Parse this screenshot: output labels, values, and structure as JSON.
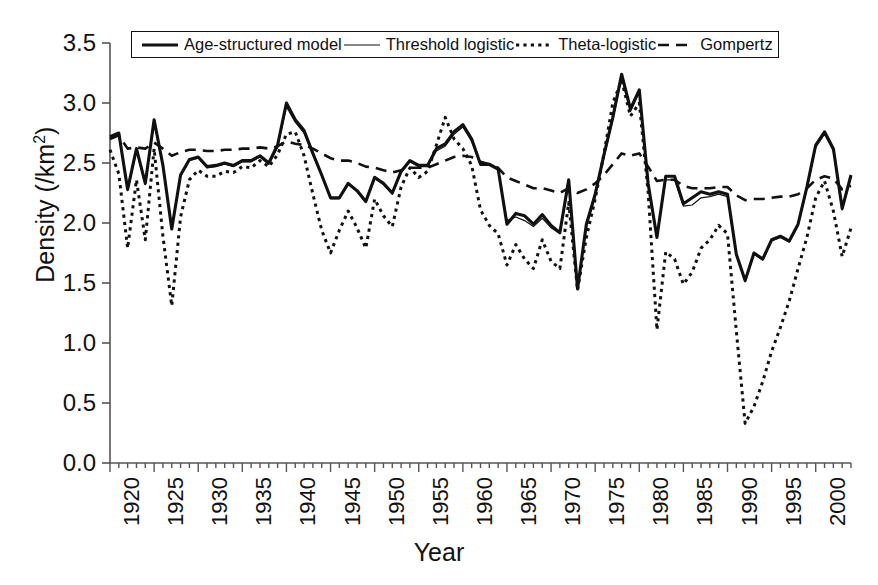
{
  "chart_data": {
    "type": "line",
    "title": "",
    "xlabel": "Year",
    "ylabel": "Density (/km2)",
    "ylabel_html": "Density (/km<sup>2</sup>)",
    "xlim": [
      1920,
      2004
    ],
    "ylim": [
      0.0,
      3.5
    ],
    "ytick_labels": [
      "0.0",
      "0.5",
      "1.0",
      "1.5",
      "2.0",
      "2.5",
      "3.0",
      "3.5"
    ],
    "ytick_values": [
      0.0,
      0.5,
      1.0,
      1.5,
      2.0,
      2.5,
      3.0,
      3.5
    ],
    "xtick_labels": [
      "1920",
      "1925",
      "1930",
      "1935",
      "1940",
      "1945",
      "1950",
      "1955",
      "1960",
      "1965",
      "1970",
      "1975",
      "1980",
      "1985",
      "1990",
      "1995",
      "2000"
    ],
    "xtick_values": [
      1920,
      1925,
      1930,
      1935,
      1940,
      1945,
      1950,
      1955,
      1960,
      1965,
      1970,
      1975,
      1980,
      1985,
      1990,
      1995,
      2000
    ],
    "minor_xtick_step": 1,
    "grid": false,
    "legend_position": "top-inside-boxed",
    "x": [
      1920,
      1921,
      1922,
      1923,
      1924,
      1925,
      1926,
      1927,
      1928,
      1929,
      1930,
      1931,
      1932,
      1933,
      1934,
      1935,
      1936,
      1937,
      1938,
      1939,
      1940,
      1941,
      1942,
      1943,
      1944,
      1945,
      1946,
      1947,
      1948,
      1949,
      1950,
      1951,
      1952,
      1953,
      1954,
      1955,
      1956,
      1957,
      1958,
      1959,
      1960,
      1961,
      1962,
      1963,
      1964,
      1965,
      1966,
      1967,
      1968,
      1969,
      1970,
      1971,
      1972,
      1973,
      1974,
      1975,
      1976,
      1977,
      1978,
      1979,
      1980,
      1981,
      1982,
      1983,
      1984,
      1985,
      1986,
      1987,
      1988,
      1989,
      1990,
      1991,
      1992,
      1993,
      1994,
      1995,
      1996,
      1997,
      1998,
      1999,
      2000,
      2001,
      2002,
      2003,
      2004
    ],
    "series": [
      {
        "name": "Age-structured model",
        "style": "solid-thick",
        "values": [
          2.72,
          2.75,
          2.28,
          2.62,
          2.33,
          2.86,
          2.48,
          1.95,
          2.4,
          2.53,
          2.55,
          2.47,
          2.48,
          2.5,
          2.48,
          2.52,
          2.52,
          2.56,
          2.5,
          2.65,
          3.0,
          2.86,
          2.77,
          2.58,
          2.4,
          2.21,
          2.21,
          2.33,
          2.27,
          2.18,
          2.38,
          2.33,
          2.25,
          2.43,
          2.52,
          2.48,
          2.48,
          2.62,
          2.66,
          2.76,
          2.82,
          2.7,
          2.49,
          2.49,
          2.45,
          1.99,
          2.08,
          2.06,
          1.99,
          2.07,
          1.98,
          1.92,
          2.36,
          1.45,
          1.99,
          2.24,
          2.57,
          2.88,
          3.24,
          2.95,
          3.11,
          2.33,
          1.88,
          2.39,
          2.39,
          2.16,
          2.21,
          2.26,
          2.24,
          2.26,
          2.24,
          1.74,
          1.52,
          1.75,
          1.7,
          1.86,
          1.89,
          1.85,
          1.99,
          2.3,
          2.65,
          2.76,
          2.62,
          2.12,
          2.4
        ]
      },
      {
        "name": "Threshold logistic",
        "style": "solid-thin",
        "values": [
          2.7,
          2.73,
          2.27,
          2.6,
          2.32,
          2.84,
          2.47,
          1.96,
          2.39,
          2.52,
          2.54,
          2.46,
          2.47,
          2.49,
          2.47,
          2.51,
          2.51,
          2.55,
          2.49,
          2.63,
          2.97,
          2.84,
          2.75,
          2.57,
          2.39,
          2.2,
          2.2,
          2.32,
          2.26,
          2.17,
          2.37,
          2.32,
          2.24,
          2.42,
          2.51,
          2.47,
          2.47,
          2.6,
          2.64,
          2.74,
          2.8,
          2.68,
          2.48,
          2.48,
          2.44,
          2.02,
          2.05,
          2.02,
          1.97,
          2.04,
          1.96,
          1.91,
          2.33,
          1.46,
          1.97,
          2.22,
          2.55,
          2.86,
          3.21,
          2.93,
          3.09,
          2.32,
          1.88,
          2.36,
          2.36,
          2.14,
          2.15,
          2.21,
          2.22,
          2.24,
          2.22,
          1.73,
          1.51,
          1.74,
          1.69,
          1.85,
          1.88,
          1.84,
          1.98,
          2.28,
          2.63,
          2.74,
          2.6,
          2.11,
          2.38
        ]
      },
      {
        "name": "Theta-logistic",
        "style": "dotted",
        "values": [
          2.61,
          2.41,
          1.79,
          2.36,
          1.86,
          2.62,
          1.89,
          1.31,
          2.05,
          2.36,
          2.44,
          2.39,
          2.39,
          2.43,
          2.42,
          2.47,
          2.46,
          2.52,
          2.47,
          2.57,
          2.74,
          2.76,
          2.56,
          2.24,
          1.94,
          1.75,
          1.94,
          2.1,
          1.96,
          1.79,
          2.2,
          2.06,
          1.97,
          2.3,
          2.46,
          2.38,
          2.43,
          2.65,
          2.88,
          2.7,
          2.62,
          2.48,
          2.11,
          1.98,
          1.91,
          1.65,
          1.82,
          1.7,
          1.62,
          1.86,
          1.68,
          1.62,
          2.17,
          1.44,
          1.88,
          2.2,
          2.58,
          3.0,
          3.19,
          2.89,
          3.0,
          2.26,
          1.11,
          1.76,
          1.7,
          1.49,
          1.59,
          1.79,
          1.86,
          1.98,
          1.91,
          1.1,
          0.33,
          0.47,
          0.68,
          0.93,
          1.13,
          1.35,
          1.62,
          1.88,
          2.21,
          2.35,
          2.1,
          1.72,
          1.96
        ]
      },
      {
        "name": "Gompertz",
        "style": "dashed",
        "values": [
          2.7,
          2.73,
          2.62,
          2.63,
          2.62,
          2.67,
          2.62,
          2.56,
          2.59,
          2.61,
          2.61,
          2.6,
          2.6,
          2.61,
          2.61,
          2.62,
          2.62,
          2.63,
          2.62,
          2.64,
          2.68,
          2.66,
          2.65,
          2.62,
          2.58,
          2.54,
          2.52,
          2.52,
          2.5,
          2.47,
          2.46,
          2.44,
          2.42,
          2.44,
          2.46,
          2.46,
          2.46,
          2.49,
          2.52,
          2.55,
          2.56,
          2.55,
          2.51,
          2.49,
          2.46,
          2.38,
          2.35,
          2.32,
          2.29,
          2.29,
          2.27,
          2.25,
          2.29,
          2.25,
          2.28,
          2.33,
          2.4,
          2.49,
          2.58,
          2.56,
          2.58,
          2.47,
          2.35,
          2.36,
          2.36,
          2.31,
          2.29,
          2.29,
          2.29,
          2.3,
          2.3,
          2.23,
          2.19,
          2.2,
          2.2,
          2.21,
          2.22,
          2.22,
          2.24,
          2.29,
          2.36,
          2.39,
          2.37,
          2.28,
          2.31
        ]
      }
    ]
  },
  "legend": {
    "entries": [
      {
        "label": "Age-structured model",
        "style": "solid-thick"
      },
      {
        "label": "Threshold logistic",
        "style": "solid-thin"
      },
      {
        "label": "Theta-logistic",
        "style": "dotted"
      },
      {
        "label": "Gompertz",
        "style": "dashed"
      }
    ]
  },
  "colors": {
    "line": "#111111",
    "axis": "#555555",
    "background": "#ffffff"
  }
}
